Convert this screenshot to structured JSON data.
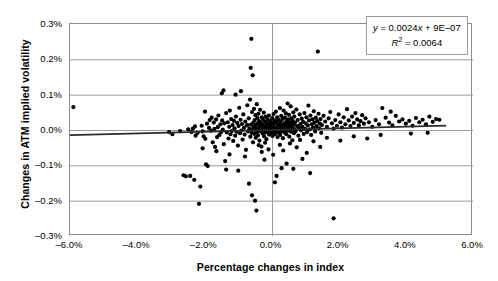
{
  "chart_data": {
    "type": "scatter",
    "title": "",
    "xlabel": "Percentage changes in index",
    "ylabel": "Changes in ATM implied volatility",
    "xlim": [
      -6.0,
      6.0
    ],
    "ylim": [
      -0.3,
      0.3
    ],
    "xticks": [
      "-6.0%",
      "-4.0%",
      "-2.0%",
      "0.0%",
      "2.0%",
      "4.0%",
      "6.0%"
    ],
    "xtick_values": [
      -6.0,
      -4.0,
      -2.0,
      0.0,
      2.0,
      4.0,
      6.0
    ],
    "yticks": [
      "0.3%",
      "0.2%",
      "0.1%",
      "0.0%",
      "-0.1%",
      "-0.2%",
      "-0.3%"
    ],
    "ytick_values": [
      0.3,
      0.2,
      0.1,
      0.0,
      -0.1,
      -0.2,
      -0.3
    ],
    "grid": true,
    "grid_color": "#9a9a9a",
    "legend": "none",
    "marker_color": "#000000",
    "marker_size": 2.1,
    "trendline": {
      "equation": "y = 0.0024x + 9E–07",
      "r_squared_label": "R² = 0.0064",
      "slope": 0.0024,
      "intercept": 9e-07,
      "r_squared": 0.0064,
      "color": "#2b2b2b",
      "x_start": -6.0,
      "x_end": 5.2
    },
    "annotations": [
      {
        "text": "y = 0.0024x + 9E–07",
        "position": "top-right"
      },
      {
        "text": "R² = 0.0064",
        "position": "top-right"
      }
    ],
    "n_points": 322,
    "points": [
      [
        -5.9,
        0.065
      ],
      [
        -3.05,
        -0.006
      ],
      [
        -2.72,
        -0.003
      ],
      [
        -2.62,
        -0.128
      ],
      [
        -2.55,
        -0.131
      ],
      [
        -2.42,
        -0.13
      ],
      [
        -2.38,
        -0.006
      ],
      [
        -2.34,
        0.004
      ],
      [
        -2.3,
        -0.141
      ],
      [
        -2.28,
        0.01
      ],
      [
        -2.2,
        -0.008
      ],
      [
        -2.16,
        -0.209
      ],
      [
        -2.12,
        -0.16
      ],
      [
        -2.08,
        0.012
      ],
      [
        -2.05,
        -0.004
      ],
      [
        -2.02,
        -0.018
      ],
      [
        -1.98,
        0.052
      ],
      [
        -1.95,
        -0.097
      ],
      [
        -1.92,
        0.018
      ],
      [
        -1.9,
        -0.102
      ],
      [
        -1.86,
        0.006
      ],
      [
        -1.84,
        0.028
      ],
      [
        -1.8,
        -0.002
      ],
      [
        -1.78,
        0.035
      ],
      [
        -1.75,
        -0.035
      ],
      [
        -1.72,
        0.021
      ],
      [
        -1.7,
        0.003
      ],
      [
        -1.68,
        -0.048
      ],
      [
        -1.65,
        0.03
      ],
      [
        -1.62,
        -0.02
      ],
      [
        -1.6,
        0.008
      ],
      [
        -1.58,
        0.041
      ],
      [
        -1.55,
        -0.014
      ],
      [
        -1.52,
        0.016
      ],
      [
        -1.5,
        -0.006
      ],
      [
        -1.47,
        0.027
      ],
      [
        -1.45,
        0.001
      ],
      [
        -1.42,
        -0.04
      ],
      [
        -1.4,
        0.019
      ],
      [
        -1.38,
        -0.088
      ],
      [
        -1.35,
        0.048
      ],
      [
        -1.33,
        -0.007
      ],
      [
        -1.3,
        0.022
      ],
      [
        -1.28,
        -0.024
      ],
      [
        -1.26,
        0.009
      ],
      [
        -1.24,
        0.055
      ],
      [
        -1.22,
        -0.012
      ],
      [
        -1.2,
        0.031
      ],
      [
        -1.18,
        -0.003
      ],
      [
        -1.16,
        0.014
      ],
      [
        -1.14,
        -0.031
      ],
      [
        -1.12,
        0.026
      ],
      [
        -1.1,
        0.005
      ],
      [
        -1.08,
        -0.016
      ],
      [
        -1.06,
        0.038
      ],
      [
        -1.04,
        -0.005
      ],
      [
        -1.02,
        0.02
      ],
      [
        -1.0,
        -0.044
      ],
      [
        -0.98,
        0.011
      ],
      [
        -0.96,
        0.063
      ],
      [
        -0.94,
        -0.009
      ],
      [
        -0.92,
        0.029
      ],
      [
        -0.9,
        -0.002
      ],
      [
        -0.88,
        0.017
      ],
      [
        -0.86,
        -0.027
      ],
      [
        -0.84,
        0.044
      ],
      [
        -0.82,
        0.006
      ],
      [
        -0.8,
        -0.013
      ],
      [
        -0.78,
        0.024
      ],
      [
        -0.76,
        -0.056
      ],
      [
        -0.74,
        0.013
      ],
      [
        -0.72,
        0.07
      ],
      [
        -0.7,
        -0.004
      ],
      [
        -0.68,
        0.033
      ],
      [
        -0.66,
        0.003
      ],
      [
        -0.64,
        0.086
      ],
      [
        -0.63,
        -0.019
      ],
      [
        -0.62,
        0.176
      ],
      [
        -0.61,
        0.015
      ],
      [
        -0.6,
        0.258
      ],
      [
        -0.59,
        -0.008
      ],
      [
        -0.58,
        0.051
      ],
      [
        -0.57,
        0.002
      ],
      [
        -0.56,
        0.155
      ],
      [
        -0.55,
        -0.035
      ],
      [
        -0.54,
        0.021
      ],
      [
        -0.53,
        0.009
      ],
      [
        -0.52,
        0.06
      ],
      [
        -0.51,
        -0.011
      ],
      [
        -0.5,
        0.028
      ],
      [
        -0.49,
        0.001
      ],
      [
        -0.48,
        0.042
      ],
      [
        -0.47,
        -0.022
      ],
      [
        -0.46,
        0.014
      ],
      [
        -0.45,
        0.005
      ],
      [
        -0.44,
        0.073
      ],
      [
        -0.43,
        -0.006
      ],
      [
        -0.42,
        0.034
      ],
      [
        -0.41,
        0.018
      ],
      [
        -0.4,
        -0.015
      ],
      [
        -0.39,
        0.046
      ],
      [
        -0.38,
        0.002
      ],
      [
        -0.37,
        0.025
      ],
      [
        -0.36,
        -0.03
      ],
      [
        -0.35,
        0.011
      ],
      [
        -0.34,
        0.057
      ],
      [
        -0.33,
        -0.003
      ],
      [
        -0.32,
        0.02
      ],
      [
        -0.31,
        0.007
      ],
      [
        -0.3,
        -0.047
      ],
      [
        -0.29,
        0.036
      ],
      [
        -0.28,
        0.0
      ],
      [
        -0.27,
        0.016
      ],
      [
        -0.26,
        -0.01
      ],
      [
        -0.25,
        0.029
      ],
      [
        -0.24,
        0.004
      ],
      [
        -0.23,
        0.049
      ],
      [
        -0.22,
        -0.018
      ],
      [
        -0.21,
        0.012
      ],
      [
        -0.2,
        0.001
      ],
      [
        -0.19,
        0.023
      ],
      [
        -0.18,
        -0.007
      ],
      [
        -0.17,
        0.038
      ],
      [
        -0.16,
        0.006
      ],
      [
        -0.15,
        -0.026
      ],
      [
        -0.14,
        0.015
      ],
      [
        -0.13,
        0.003
      ],
      [
        -0.12,
        0.031
      ],
      [
        -0.11,
        -0.005
      ],
      [
        -0.1,
        0.019
      ],
      [
        -0.09,
        0.0
      ],
      [
        -0.08,
        0.041
      ],
      [
        -0.07,
        -0.013
      ],
      [
        -0.06,
        0.009
      ],
      [
        -0.05,
        0.002
      ],
      [
        -0.04,
        0.026
      ],
      [
        -0.03,
        -0.002
      ],
      [
        -0.02,
        0.013
      ],
      [
        -0.01,
        0.005
      ],
      [
        0.0,
        -0.009
      ],
      [
        0.0,
        0.022
      ],
      [
        0.01,
        0.0
      ],
      [
        0.02,
        0.034
      ],
      [
        0.03,
        -0.017
      ],
      [
        0.04,
        0.01
      ],
      [
        0.05,
        0.003
      ],
      [
        0.06,
        0.045
      ],
      [
        0.07,
        -0.006
      ],
      [
        0.08,
        0.018
      ],
      [
        0.09,
        0.001
      ],
      [
        0.1,
        0.027
      ],
      [
        0.11,
        -0.011
      ],
      [
        0.12,
        0.007
      ],
      [
        0.13,
        0.052
      ],
      [
        0.14,
        -0.003
      ],
      [
        0.15,
        0.021
      ],
      [
        0.16,
        0.004
      ],
      [
        0.17,
        0.036
      ],
      [
        0.18,
        -0.02
      ],
      [
        0.19,
        0.012
      ],
      [
        0.2,
        0.002
      ],
      [
        0.21,
        0.029
      ],
      [
        0.22,
        -0.008
      ],
      [
        0.23,
        0.016
      ],
      [
        0.24,
        0.0
      ],
      [
        0.25,
        0.062
      ],
      [
        0.26,
        -0.014
      ],
      [
        0.27,
        0.024
      ],
      [
        0.28,
        0.006
      ],
      [
        0.29,
        0.04
      ],
      [
        0.3,
        -0.004
      ],
      [
        0.31,
        0.014
      ],
      [
        0.32,
        0.002
      ],
      [
        0.33,
        0.031
      ],
      [
        0.34,
        -0.023
      ],
      [
        0.35,
        0.009
      ],
      [
        0.36,
        0.055
      ],
      [
        0.37,
        0.003
      ],
      [
        0.38,
        0.019
      ],
      [
        0.39,
        -0.007
      ],
      [
        0.4,
        0.035
      ],
      [
        0.41,
        0.001
      ],
      [
        0.42,
        0.012
      ],
      [
        0.43,
        0.047
      ],
      [
        0.44,
        -0.012
      ],
      [
        0.45,
        0.025
      ],
      [
        0.46,
        0.005
      ],
      [
        0.47,
        0.017
      ],
      [
        0.48,
        0.075
      ],
      [
        0.49,
        -0.002
      ],
      [
        0.5,
        0.03
      ],
      [
        0.51,
        0.008
      ],
      [
        0.52,
        0.043
      ],
      [
        0.53,
        -0.019
      ],
      [
        0.54,
        0.013
      ],
      [
        0.55,
        0.0
      ],
      [
        0.56,
        0.022
      ],
      [
        0.57,
        0.067
      ],
      [
        0.58,
        -0.005
      ],
      [
        0.59,
        0.033
      ],
      [
        0.6,
        0.01
      ],
      [
        0.61,
        0.018
      ],
      [
        0.62,
        -0.029
      ],
      [
        0.63,
        0.026
      ],
      [
        0.64,
        0.004
      ],
      [
        0.65,
        0.05
      ],
      [
        0.66,
        0.015
      ],
      [
        0.67,
        -0.009
      ],
      [
        0.68,
        0.038
      ],
      [
        0.69,
        0.002
      ],
      [
        0.7,
        0.021
      ],
      [
        0.72,
        -0.003
      ],
      [
        0.74,
        0.058
      ],
      [
        0.76,
        0.011
      ],
      [
        0.78,
        0.028
      ],
      [
        0.8,
        -0.016
      ],
      [
        0.82,
        0.006
      ],
      [
        0.84,
        0.044
      ],
      [
        0.86,
        0.017
      ],
      [
        0.88,
        -0.001
      ],
      [
        0.9,
        0.032
      ],
      [
        0.92,
        0.009
      ],
      [
        0.94,
        0.023
      ],
      [
        0.96,
        -0.011
      ],
      [
        0.98,
        0.048
      ],
      [
        1.0,
        0.003
      ],
      [
        1.02,
        0.019
      ],
      [
        1.04,
        0.036
      ],
      [
        1.06,
        -0.006
      ],
      [
        1.08,
        0.013
      ],
      [
        1.1,
        0.069
      ],
      [
        1.12,
        0.027
      ],
      [
        1.14,
        0.002
      ],
      [
        1.16,
        0.041
      ],
      [
        1.18,
        -0.014
      ],
      [
        1.2,
        0.016
      ],
      [
        1.22,
        0.03
      ],
      [
        1.24,
        0.007
      ],
      [
        1.26,
        0.053
      ],
      [
        1.28,
        0.021
      ],
      [
        1.3,
        -0.004
      ],
      [
        1.32,
        0.035
      ],
      [
        1.34,
        0.011
      ],
      [
        1.36,
        0.025
      ],
      [
        1.38,
        0.222
      ],
      [
        1.4,
        0.046
      ],
      [
        1.42,
        0.005
      ],
      [
        1.44,
        0.018
      ],
      [
        1.46,
        0.031
      ],
      [
        1.48,
        -0.008
      ],
      [
        1.5,
        0.014
      ],
      [
        1.55,
        0.04
      ],
      [
        1.6,
        0.024
      ],
      [
        1.65,
        0.009
      ],
      [
        1.7,
        0.033
      ],
      [
        1.75,
        0.051
      ],
      [
        1.8,
        0.019
      ],
      [
        1.85,
        0.004
      ],
      [
        1.9,
        0.028
      ],
      [
        1.95,
        0.012
      ],
      [
        2.0,
        0.044
      ],
      [
        2.05,
        0.022
      ],
      [
        2.1,
        0.007
      ],
      [
        2.15,
        0.036
      ],
      [
        2.2,
        0.016
      ],
      [
        2.25,
        0.059
      ],
      [
        2.3,
        0.027
      ],
      [
        2.35,
        0.011
      ],
      [
        2.4,
        0.038
      ],
      [
        2.45,
        0.02
      ],
      [
        2.5,
        0.048
      ],
      [
        2.55,
        0.03
      ],
      [
        2.6,
        0.013
      ],
      [
        2.65,
        0.025
      ],
      [
        2.7,
        0.042
      ],
      [
        2.75,
        0.018
      ],
      [
        2.8,
        0.033
      ],
      [
        2.9,
        0.022
      ],
      [
        3.0,
        0.009
      ],
      [
        3.1,
        0.028
      ],
      [
        3.2,
        0.016
      ],
      [
        3.3,
        0.062
      ],
      [
        3.4,
        0.035
      ],
      [
        3.5,
        0.021
      ],
      [
        3.6,
        0.013
      ],
      [
        3.7,
        0.04
      ],
      [
        3.8,
        0.024
      ],
      [
        3.9,
        0.03
      ],
      [
        4.0,
        0.018
      ],
      [
        4.1,
        0.026
      ],
      [
        4.2,
        0.012
      ],
      [
        4.3,
        0.034
      ],
      [
        4.4,
        0.022
      ],
      [
        4.5,
        0.029
      ],
      [
        4.6,
        0.016
      ],
      [
        4.7,
        0.038
      ],
      [
        4.8,
        0.023
      ],
      [
        4.9,
        0.031
      ],
      [
        -2.95,
        -0.012
      ],
      [
        -2.48,
        0.002
      ],
      [
        -2.26,
        -0.016
      ],
      [
        -1.97,
        -0.025
      ],
      [
        -1.64,
        -0.06
      ],
      [
        -1.48,
        0.104
      ],
      [
        -1.43,
        0.112
      ],
      [
        -1.25,
        -0.069
      ],
      [
        -1.07,
        0.1
      ],
      [
        -0.99,
        -0.115
      ],
      [
        -0.91,
        0.11
      ],
      [
        -0.79,
        -0.075
      ],
      [
        -0.71,
        0.014
      ],
      [
        -0.67,
        -0.152
      ],
      [
        -0.49,
        -0.2
      ],
      [
        -0.45,
        -0.228
      ],
      [
        -0.38,
        -0.043
      ],
      [
        -0.29,
        -0.062
      ],
      [
        -0.19,
        -0.036
      ],
      [
        -0.09,
        -0.055
      ],
      [
        0.05,
        -0.07
      ],
      [
        0.15,
        -0.13
      ],
      [
        0.25,
        -0.042
      ],
      [
        0.35,
        -0.058
      ],
      [
        0.45,
        -0.095
      ],
      [
        0.55,
        -0.038
      ],
      [
        0.65,
        -0.11
      ],
      [
        0.75,
        -0.049
      ],
      [
        0.85,
        -0.028
      ],
      [
        1.05,
        -0.065
      ],
      [
        1.25,
        -0.032
      ],
      [
        1.45,
        -0.048
      ],
      [
        1.65,
        -0.022
      ],
      [
        1.85,
        -0.25
      ],
      [
        2.05,
        -0.03
      ],
      [
        2.45,
        -0.018
      ],
      [
        2.85,
        -0.024
      ],
      [
        3.25,
        -0.014
      ],
      [
        3.55,
        0.052
      ],
      [
        4.15,
        -0.01
      ],
      [
        4.65,
        -0.008
      ],
      [
        5.0,
        0.029
      ],
      [
        -0.58,
        -0.185
      ],
      [
        -0.21,
        -0.084
      ],
      [
        0.1,
        -0.148
      ],
      [
        0.92,
        -0.082
      ],
      [
        1.15,
        -0.122
      ],
      [
        -1.35,
        -0.112
      ],
      [
        -2.05,
        -0.052
      ],
      [
        0.3,
        -0.108
      ]
    ]
  }
}
